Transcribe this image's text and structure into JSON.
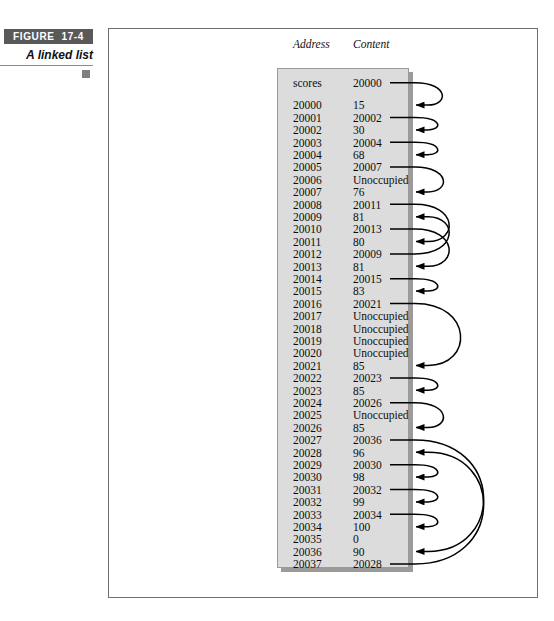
{
  "figure": {
    "label_word": "FIGURE",
    "label_number": "17-4",
    "caption": "A linked list",
    "bullet_icon": "square-bullet"
  },
  "table": {
    "headers": {
      "address": "Address",
      "content": "Content"
    },
    "rows": [
      {
        "address": "scores",
        "content": "20000",
        "pointer": true,
        "target": "20000"
      },
      {
        "address": "20000",
        "content": "15",
        "pointer": false,
        "target": null
      },
      {
        "address": "20001",
        "content": "20002",
        "pointer": true,
        "target": "20002"
      },
      {
        "address": "20002",
        "content": "30",
        "pointer": false,
        "target": null
      },
      {
        "address": "20003",
        "content": "20004",
        "pointer": true,
        "target": "20004"
      },
      {
        "address": "20004",
        "content": "68",
        "pointer": false,
        "target": null
      },
      {
        "address": "20005",
        "content": "20007",
        "pointer": true,
        "target": "20007"
      },
      {
        "address": "20006",
        "content": "Unoccupied",
        "pointer": false,
        "target": null
      },
      {
        "address": "20007",
        "content": "76",
        "pointer": false,
        "target": null
      },
      {
        "address": "20008",
        "content": "20011",
        "pointer": true,
        "target": "20011"
      },
      {
        "address": "20009",
        "content": "81",
        "pointer": false,
        "target": null
      },
      {
        "address": "20010",
        "content": "20013",
        "pointer": true,
        "target": "20013"
      },
      {
        "address": "20011",
        "content": "80",
        "pointer": false,
        "target": null
      },
      {
        "address": "20012",
        "content": "20009",
        "pointer": true,
        "target": "20009"
      },
      {
        "address": "20013",
        "content": "81",
        "pointer": false,
        "target": null
      },
      {
        "address": "20014",
        "content": "20015",
        "pointer": true,
        "target": "20015"
      },
      {
        "address": "20015",
        "content": "83",
        "pointer": false,
        "target": null
      },
      {
        "address": "20016",
        "content": "20021",
        "pointer": true,
        "target": "20021"
      },
      {
        "address": "20017",
        "content": "Unoccupied",
        "pointer": false,
        "target": null
      },
      {
        "address": "20018",
        "content": "Unoccupied",
        "pointer": false,
        "target": null
      },
      {
        "address": "20019",
        "content": "Unoccupied",
        "pointer": false,
        "target": null
      },
      {
        "address": "20020",
        "content": "Unoccupied",
        "pointer": false,
        "target": null
      },
      {
        "address": "20021",
        "content": "85",
        "pointer": false,
        "target": null
      },
      {
        "address": "20022",
        "content": "20023",
        "pointer": true,
        "target": "20023"
      },
      {
        "address": "20023",
        "content": "85",
        "pointer": false,
        "target": null
      },
      {
        "address": "20024",
        "content": "20026",
        "pointer": true,
        "target": "20026"
      },
      {
        "address": "20025",
        "content": "Unoccupied",
        "pointer": false,
        "target": null
      },
      {
        "address": "20026",
        "content": "85",
        "pointer": false,
        "target": null
      },
      {
        "address": "20027",
        "content": "20036",
        "pointer": true,
        "target": "20036"
      },
      {
        "address": "20028",
        "content": "96",
        "pointer": false,
        "target": null
      },
      {
        "address": "20029",
        "content": "20030",
        "pointer": true,
        "target": "20030"
      },
      {
        "address": "20030",
        "content": "98",
        "pointer": false,
        "target": null
      },
      {
        "address": "20031",
        "content": "20032",
        "pointer": true,
        "target": "20032"
      },
      {
        "address": "20032",
        "content": "99",
        "pointer": false,
        "target": null
      },
      {
        "address": "20033",
        "content": "20034",
        "pointer": true,
        "target": "20034"
      },
      {
        "address": "20034",
        "content": "100",
        "pointer": false,
        "target": null
      },
      {
        "address": "20035",
        "content": "0",
        "pointer": false,
        "target": null
      },
      {
        "address": "20036",
        "content": "90",
        "pointer": false,
        "target": null
      },
      {
        "address": "20037",
        "content": "20028",
        "pointer": true,
        "target": "20028"
      }
    ]
  },
  "colors": {
    "panel_fill": "#dcdcdc",
    "panel_shadow": "#9b9b9b",
    "badge_bg": "#595959",
    "frame_border": "#6e6e6e",
    "arrow": "#000000"
  },
  "layout": {
    "row_height": 12.4,
    "first_row_top": 77,
    "gap_after_first_row": 10
  }
}
